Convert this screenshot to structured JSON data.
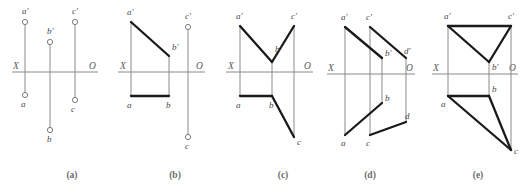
{
  "figure": {
    "background_color": "#ffffff",
    "axis_color": "#8a8a8a",
    "solid_line_color": "#1a1a1a",
    "label_color": "#4a4a4a",
    "axis_label_left": "X",
    "axis_label_right": "O"
  },
  "captions": [
    {
      "key": "a",
      "text": "(a)",
      "x": 72,
      "y": 178
    },
    {
      "key": "b",
      "text": "(b)",
      "x": 175,
      "y": 178
    },
    {
      "key": "c",
      "text": "(c)",
      "x": 283,
      "y": 178
    },
    {
      "key": "d",
      "text": "(d)",
      "x": 370,
      "y": 178
    },
    {
      "key": "e",
      "text": "(e)",
      "x": 478,
      "y": 178
    }
  ],
  "panels": [
    {
      "key": "a",
      "caption": "(a)",
      "axis": {
        "x1": 12,
        "x2": 98,
        "y": 72,
        "label_left": "X",
        "label_left_x": 13,
        "label_left_y": 69,
        "label_right": "O",
        "label_right_x": 89,
        "label_right_y": 69
      },
      "projection_lines": [
        {
          "x1": 25,
          "y1": 22,
          "x2": 25,
          "y2": 95
        },
        {
          "x1": 50,
          "y1": 42,
          "x2": 50,
          "y2": 130
        },
        {
          "x1": 75,
          "y1": 22,
          "x2": 75,
          "y2": 100
        }
      ],
      "solid_segments": [],
      "points": [
        {
          "name": "a-prime",
          "label": "a'",
          "x": 25,
          "y": 22,
          "lx": 22,
          "ly": 14
        },
        {
          "name": "b-prime",
          "label": "b'",
          "x": 50,
          "y": 42,
          "lx": 47,
          "ly": 34
        },
        {
          "name": "c-prime",
          "label": "c'",
          "x": 75,
          "y": 22,
          "lx": 72,
          "ly": 14
        },
        {
          "name": "a",
          "label": "a",
          "x": 25,
          "y": 95,
          "lx": 21,
          "ly": 107
        },
        {
          "name": "c",
          "label": "c",
          "x": 75,
          "y": 100,
          "lx": 71,
          "ly": 112
        },
        {
          "name": "b",
          "label": "b",
          "x": 50,
          "y": 130,
          "lx": 47,
          "ly": 142
        }
      ]
    },
    {
      "key": "b",
      "caption": "(b)",
      "axis": {
        "x1": 118,
        "x2": 205,
        "y": 72,
        "label_left": "X",
        "label_left_x": 120,
        "label_left_y": 69,
        "label_right": "O",
        "label_right_x": 196,
        "label_right_y": 69
      },
      "projection_lines": [
        {
          "x1": 131,
          "y1": 22,
          "x2": 131,
          "y2": 96
        },
        {
          "x1": 169,
          "y1": 56,
          "x2": 169,
          "y2": 96
        },
        {
          "x1": 188,
          "y1": 27,
          "x2": 188,
          "y2": 137
        }
      ],
      "solid_segments": [
        {
          "name": "seg-ap-bp",
          "points": "131,22 169,56"
        },
        {
          "name": "seg-a-b",
          "points": "131,96 169,96"
        }
      ],
      "points": [
        {
          "name": "a-prime",
          "label": "a'",
          "x": 131,
          "y": 22,
          "lx": 127,
          "ly": 15,
          "hide_circle": true
        },
        {
          "name": "b-prime",
          "label": "b'",
          "x": 169,
          "y": 56,
          "lx": 172,
          "ly": 50,
          "hide_circle": true
        },
        {
          "name": "c-prime",
          "label": "c'",
          "x": 188,
          "y": 27,
          "lx": 185,
          "ly": 19
        },
        {
          "name": "a",
          "label": "a",
          "x": 131,
          "y": 96,
          "lx": 127,
          "ly": 108,
          "hide_circle": true
        },
        {
          "name": "b",
          "label": "b",
          "x": 169,
          "y": 96,
          "lx": 166,
          "ly": 108,
          "hide_circle": true
        },
        {
          "name": "c",
          "label": "c",
          "x": 188,
          "y": 137,
          "lx": 185,
          "ly": 149
        }
      ]
    },
    {
      "key": "c",
      "caption": "(c)",
      "axis": {
        "x1": 226,
        "x2": 313,
        "y": 72,
        "label_left": "X",
        "label_left_x": 228,
        "label_left_y": 69,
        "label_right": "O",
        "label_right_x": 304,
        "label_right_y": 69
      },
      "projection_lines": [
        {
          "x1": 240,
          "y1": 26,
          "x2": 240,
          "y2": 96
        },
        {
          "x1": 272,
          "y1": 62,
          "x2": 272,
          "y2": 96
        },
        {
          "x1": 294,
          "y1": 26,
          "x2": 294,
          "y2": 137
        }
      ],
      "solid_segments": [
        {
          "name": "seg-ap-bp",
          "points": "240,26 272,62"
        },
        {
          "name": "seg-bp-cp",
          "points": "272,62 294,26"
        },
        {
          "name": "seg-a-b",
          "points": "240,96 272,96"
        },
        {
          "name": "seg-b-c",
          "points": "272,96 294,137"
        }
      ],
      "points": [
        {
          "name": "a-prime",
          "label": "a'",
          "x": 240,
          "y": 26,
          "lx": 236,
          "ly": 19,
          "hide_circle": true
        },
        {
          "name": "b-prime",
          "label": "b'",
          "x": 272,
          "y": 62,
          "lx": 275,
          "ly": 52,
          "hide_circle": true
        },
        {
          "name": "c-prime",
          "label": "c'",
          "x": 294,
          "y": 26,
          "lx": 291,
          "ly": 19,
          "hide_circle": true
        },
        {
          "name": "a",
          "label": "a",
          "x": 240,
          "y": 96,
          "lx": 236,
          "ly": 108,
          "hide_circle": true
        },
        {
          "name": "b",
          "label": "b",
          "x": 272,
          "y": 96,
          "lx": 269,
          "ly": 108,
          "hide_circle": true
        },
        {
          "name": "c",
          "label": "c",
          "x": 294,
          "y": 137,
          "lx": 297,
          "ly": 145,
          "hide_circle": true
        }
      ]
    },
    {
      "key": "d",
      "caption": "(d)",
      "axis": {
        "x1": 327,
        "x2": 415,
        "y": 74,
        "label_left": "X",
        "label_left_x": 328,
        "label_left_y": 71,
        "label_right": "O",
        "label_right_x": 406,
        "label_right_y": 71
      },
      "projection_lines": [
        {
          "x1": 345,
          "y1": 27,
          "x2": 345,
          "y2": 135
        },
        {
          "x1": 370,
          "y1": 27,
          "x2": 370,
          "y2": 135
        },
        {
          "x1": 382,
          "y1": 58,
          "x2": 382,
          "y2": 103
        },
        {
          "x1": 406,
          "y1": 58,
          "x2": 406,
          "y2": 122
        }
      ],
      "solid_segments": [
        {
          "name": "seg-ap-bp",
          "points": "345,27 382,58"
        },
        {
          "name": "seg-cp-dp",
          "points": "370,27 406,58"
        },
        {
          "name": "seg-a-b",
          "points": "345,135 382,103"
        },
        {
          "name": "seg-c-d",
          "points": "370,135 406,122"
        }
      ],
      "points": [
        {
          "name": "a-prime",
          "label": "a'",
          "x": 345,
          "y": 27,
          "lx": 341,
          "ly": 20,
          "hide_circle": true
        },
        {
          "name": "c-prime",
          "label": "c'",
          "x": 370,
          "y": 27,
          "lx": 366,
          "ly": 20,
          "hide_circle": true
        },
        {
          "name": "b-prime",
          "label": "b'",
          "x": 382,
          "y": 58,
          "lx": 385,
          "ly": 56,
          "hide_circle": true
        },
        {
          "name": "d-prime",
          "label": "d'",
          "x": 406,
          "y": 58,
          "lx": 404,
          "ly": 54,
          "hide_circle": true
        },
        {
          "name": "b",
          "label": "b",
          "x": 382,
          "y": 103,
          "lx": 385,
          "ly": 101,
          "hide_circle": true
        },
        {
          "name": "d",
          "label": "d",
          "x": 406,
          "y": 122,
          "lx": 405,
          "ly": 119,
          "hide_circle": true
        },
        {
          "name": "a",
          "label": "a",
          "x": 345,
          "y": 135,
          "lx": 341,
          "ly": 146,
          "hide_circle": true
        },
        {
          "name": "c",
          "label": "c",
          "x": 370,
          "y": 135,
          "lx": 366,
          "ly": 146,
          "hide_circle": true
        }
      ]
    },
    {
      "key": "e",
      "caption": "(e)",
      "axis": {
        "x1": 432,
        "x2": 518,
        "y": 74,
        "label_left": "X",
        "label_left_x": 433,
        "label_left_y": 71,
        "label_right": "O",
        "label_right_x": 509,
        "label_right_y": 71
      },
      "projection_lines": [
        {
          "x1": 448,
          "y1": 26,
          "x2": 448,
          "y2": 96
        },
        {
          "x1": 489,
          "y1": 62,
          "x2": 489,
          "y2": 96
        },
        {
          "x1": 511,
          "y1": 26,
          "x2": 511,
          "y2": 150
        }
      ],
      "solid_segments": [
        {
          "name": "seg-ap-cp",
          "points": "448,26 511,26"
        },
        {
          "name": "seg-ap-bp",
          "points": "448,26 489,62"
        },
        {
          "name": "seg-cp-bp",
          "points": "511,26 489,62"
        },
        {
          "name": "seg-a-b",
          "points": "448,96 489,96"
        },
        {
          "name": "seg-a-c",
          "points": "448,96 511,150"
        },
        {
          "name": "seg-b-c",
          "points": "489,96 511,150"
        }
      ],
      "points": [
        {
          "name": "a-prime",
          "label": "a'",
          "x": 448,
          "y": 26,
          "lx": 444,
          "ly": 19,
          "hide_circle": true
        },
        {
          "name": "c-prime",
          "label": "c'",
          "x": 511,
          "y": 26,
          "lx": 508,
          "ly": 19,
          "hide_circle": true
        },
        {
          "name": "b-prime",
          "label": "b'",
          "x": 489,
          "y": 62,
          "lx": 492,
          "ly": 70,
          "hide_circle": true
        },
        {
          "name": "a",
          "label": "a",
          "x": 448,
          "y": 96,
          "lx": 441,
          "ly": 107,
          "hide_circle": true
        },
        {
          "name": "b",
          "label": "b",
          "x": 489,
          "y": 96,
          "lx": 492,
          "ly": 92,
          "hide_circle": true
        },
        {
          "name": "c",
          "label": "c",
          "x": 511,
          "y": 150,
          "lx": 514,
          "ly": 154,
          "hide_circle": true
        }
      ]
    }
  ]
}
